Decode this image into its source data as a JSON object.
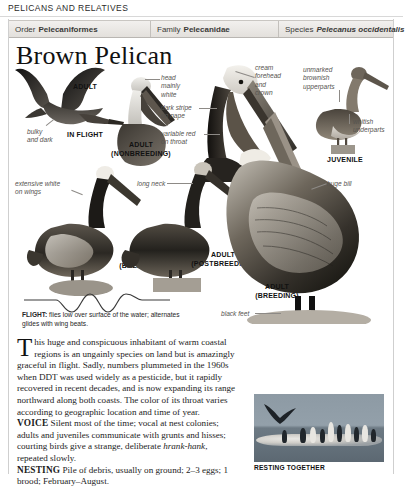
{
  "running_head": "PELICANS AND RELATIVES",
  "taxonomy": [
    {
      "label": "Order",
      "value": "Pelecaniformes",
      "italic": false
    },
    {
      "label": "Family",
      "value": "Pelecanidae",
      "italic": false
    },
    {
      "label": "Species",
      "value": "Pelecanus occidentalis",
      "italic": true
    }
  ],
  "title": "Brown Pelican",
  "plate": {
    "stage_labels": [
      {
        "id": "adult-in-flight",
        "lines": [
          "ADULT",
          "IN FLIGHT"
        ]
      },
      {
        "id": "adult-nonbreeding",
        "lines": [
          "ADULT",
          "(NONBREEDING)"
        ]
      },
      {
        "id": "adult-breeding-left",
        "lines": [
          "ADULT",
          "(BREEDING)"
        ]
      },
      {
        "id": "adult-postbreeding",
        "lines": [
          "ADULT",
          "(POSTBREEDING)"
        ]
      },
      {
        "id": "juvenile",
        "lines": [
          "JUVENILE"
        ]
      },
      {
        "id": "adult-breeding-main",
        "lines": [
          "ADULT",
          "(BREEDING)"
        ]
      }
    ],
    "callouts": [
      {
        "id": "bulky-and-dark",
        "text": "bulky\nand dark"
      },
      {
        "id": "head-mainly-white",
        "text": "head\nmainly\nwhite"
      },
      {
        "id": "dark-stripe-on-nape",
        "text": "dark stripe\non nape"
      },
      {
        "id": "variable-red-on-throat",
        "text": "variable red\non throat"
      },
      {
        "id": "cream-forehead-and-crown",
        "text": "cream\nforehead\nand\ncrown"
      },
      {
        "id": "unmarked-brownish-upperparts",
        "text": "unmarked\nbrownish\nupperparts"
      },
      {
        "id": "whitish-underparts",
        "text": "whitish\nunderparts"
      },
      {
        "id": "extensive-white-on-wings",
        "text": "extensive white\non wings"
      },
      {
        "id": "long-neck",
        "text": "long neck"
      },
      {
        "id": "huge-bill",
        "text": "huge bill"
      },
      {
        "id": "black-feet",
        "text": "black feet"
      }
    ]
  },
  "flight": {
    "label": "FLIGHT:",
    "text": " flies low over surface of the water; alternates glides with wing beats."
  },
  "account": {
    "dropcap": "T",
    "intro": "his huge and conspicuous inhabitant of warm coastal regions is an ungainly species on land but is amazingly graceful in flight. Sadly, numbers plummeted in the 1960s when DDT was used widely as a pesticide, but it rapidly recovered in recent decades, and is now expanding its range northward along both coasts. The color of its throat varies according to geographic location and time of year.",
    "voice_label": "VOICE",
    "voice_text_a": " Silent most of the time; vocal at nest colonies; adults and juveniles communicate with grunts and hisses; courting birds give a strange, deliberate ",
    "voice_italic": "hrank-hank",
    "voice_text_b": ", repeated slowly.",
    "nesting_label": "NESTING",
    "nesting_text": " Pile of debris, usually on ground; 2–3 eggs; 1 brood; February–August."
  },
  "photo": {
    "caption": "RESTING TOGETHER"
  },
  "colors": {
    "page_background": "#ffffff",
    "rule": "#d8d8d8",
    "taxo_bar_top": "#f2f0ee",
    "taxo_bar_bottom": "#e3e0dc",
    "callout_text": "#55534f",
    "body_text": "#1c1c1c",
    "photo_sky": "#8d9aa4"
  }
}
